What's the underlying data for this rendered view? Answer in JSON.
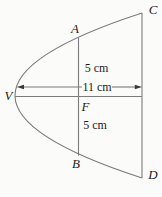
{
  "figure": {
    "point_labels": {
      "V": "V",
      "A": "A",
      "B": "B",
      "C": "C",
      "D": "D",
      "F": "F"
    },
    "measurements": {
      "upper_half_chord": "5 cm",
      "vertex_to_edge": "11 cm",
      "lower_half_chord": "5 cm"
    },
    "colors": {
      "line": "#7b7b7b",
      "arrow": "#3a3a3a",
      "text": "#1b1b1b",
      "background": "#fbfbf9"
    }
  }
}
